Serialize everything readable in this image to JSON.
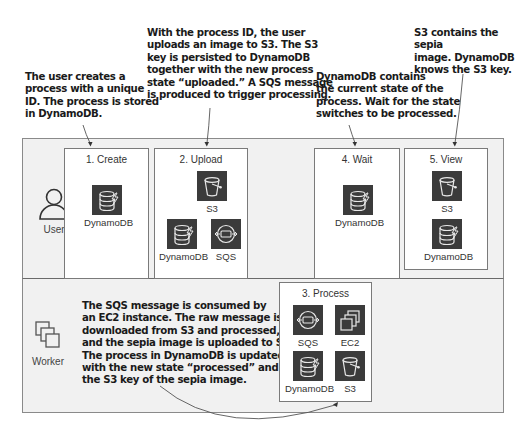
{
  "annotations": {
    "create": "The user creates a\nprocess with a unique\nID. The process is stored\nin DynamoDB.",
    "upload": "With the process ID, the user\nuploads an image to S3. The S3\nkey is persisted to DynamoDB\ntogether with the new process\nstate “uploaded.” A SQS message\nis produced to trigger processing.",
    "wait": "DynamoDB contains\nthe current state of the\nprocess. Wait for the state\nswitches to be processed.",
    "view": "S3 contains the sepia\nimage. DynamoDB\nknows the S3 key.",
    "process": "The SQS message is consumed by\nan EC2 instance. The raw message is\ndownloaded from S3 and processed,\nand the sepia image is uploaded to S3.\nThe process in DynamoDB is updated\nwith the new state “processed” and\nthe S3 key of the sepia image."
  },
  "lanes": {
    "user": {
      "label": "User",
      "icon": "user-icon"
    },
    "worker": {
      "label": "Worker",
      "icon": "worker-instances-icon"
    }
  },
  "steps": {
    "create": {
      "title": "1. Create",
      "services": [
        {
          "label": "DynamoDB",
          "icon": "dynamodb-icon"
        }
      ]
    },
    "upload": {
      "title": "2. Upload",
      "services": [
        {
          "label": "S3",
          "icon": "s3-bucket-icon"
        },
        {
          "label": "DynamoDB",
          "icon": "dynamodb-icon"
        },
        {
          "label": "SQS",
          "icon": "sqs-icon"
        }
      ]
    },
    "process": {
      "title": "3. Process",
      "services": [
        {
          "label": "SQS",
          "icon": "sqs-icon"
        },
        {
          "label": "EC2",
          "icon": "ec2-icon"
        },
        {
          "label": "DynamoDB",
          "icon": "dynamodb-icon"
        },
        {
          "label": "S3",
          "icon": "s3-bucket-icon"
        }
      ]
    },
    "wait": {
      "title": "4. Wait",
      "services": [
        {
          "label": "DynamoDB",
          "icon": "dynamodb-icon"
        }
      ]
    },
    "view": {
      "title": "5. View",
      "services": [
        {
          "label": "S3",
          "icon": "s3-bucket-icon"
        },
        {
          "label": "DynamoDB",
          "icon": "dynamodb-icon"
        }
      ]
    }
  },
  "colors": {
    "lane_bg": "#f1f1f1",
    "icon_bg": "#3b3b3b",
    "border": "#7a7a7a",
    "text": "#1a1a1a"
  }
}
